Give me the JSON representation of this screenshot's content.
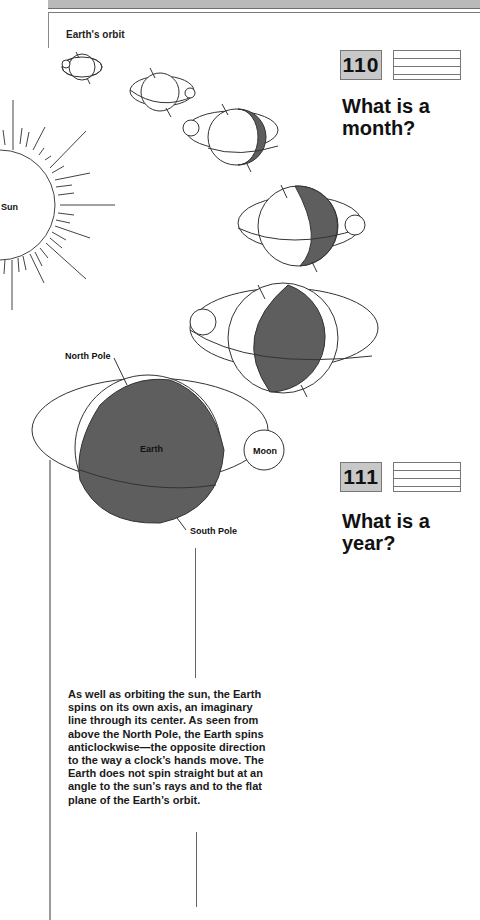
{
  "figure": {
    "caption": "Earth's orbit",
    "labels": {
      "sun": "Sun",
      "north_pole": "North Pole",
      "earth": "Earth",
      "moon": "Moon",
      "south_pole": "South Pole"
    },
    "colors": {
      "shadow": "#5e5e5e",
      "line": "#333333"
    }
  },
  "questions": [
    {
      "number": "110",
      "title_line1": "What is a",
      "title_line2": "month?"
    },
    {
      "number": "111",
      "title_line1": "What is a",
      "title_line2": "year?"
    }
  ],
  "body": {
    "paragraph": "As well as orbiting the sun, the Earth spins on its own axis, an imaginary line through its center. As seen from above the North Pole, the Earth spins anticlockwise—the opposite direction to the way a clock’s hands move. The Earth does not spin straight but at an angle to the sun’s rays and to the flat plane of the Earth’s orbit."
  }
}
